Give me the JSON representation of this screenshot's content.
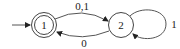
{
  "diagram": {
    "type": "finite-automaton",
    "states": [
      {
        "id": "1",
        "label": "1",
        "accepting": true,
        "start": true
      },
      {
        "id": "2",
        "label": "2",
        "accepting": false,
        "start": false
      }
    ],
    "transitions": [
      {
        "from": "1",
        "to": "2",
        "label": "0,1"
      },
      {
        "from": "2",
        "to": "1",
        "label": "0"
      },
      {
        "from": "2",
        "to": "2",
        "label": "1"
      }
    ]
  },
  "labels": {
    "state1": "1",
    "state2": "2",
    "edge_1_2": "0,1",
    "edge_2_1": "0",
    "edge_2_2": "1"
  }
}
